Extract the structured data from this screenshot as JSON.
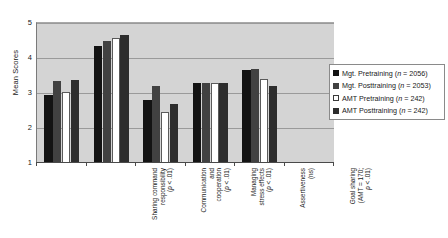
{
  "chart_data": {
    "type": "bar",
    "title": "",
    "xlabel": "",
    "ylabel": "Mean Scores",
    "ylim": [
      1,
      5
    ],
    "yticks": [
      1,
      2,
      3,
      4,
      5
    ],
    "grid": true,
    "legend_position": "right",
    "categories": [
      "Sharing command\nresponsibility\n(p < .01)",
      "Communication\nand\ncooperation\n(p < .01)",
      "Managing\nstress effects\n(p < .01)",
      "Assertiveness\n(ns)",
      "Goal sharing\n(AMT = 170;\np < .01)"
    ],
    "series": [
      {
        "name": "Mgt. Pretraining (n = 2056)",
        "values": [
          2.95,
          4.35,
          2.8,
          3.28,
          3.65
        ]
      },
      {
        "name": "Mgt. Posttraining (n = 2053)",
        "values": [
          3.35,
          4.5,
          3.2,
          3.28,
          3.7
        ]
      },
      {
        "name": "AMT Pretraining (n = 242)",
        "values": [
          3.02,
          4.57,
          2.45,
          3.28,
          3.4
        ]
      },
      {
        "name": "AMT Posttraining (n = 242)",
        "values": [
          3.38,
          4.65,
          2.7,
          3.28,
          3.2
        ]
      }
    ],
    "colors": [
      "#131313",
      "#414141",
      "#ffffff",
      "#2d2d2d"
    ]
  },
  "legend": {
    "items": [
      {
        "label_main": "Mgt. Pretraining (",
        "label_n": "n",
        "label_tail": " = 2056)"
      },
      {
        "label_main": "Mgt. Posttraining (",
        "label_n": "n",
        "label_tail": " = 2053)"
      },
      {
        "label_main": "AMT Pretraining (",
        "label_n": "n",
        "label_tail": " = 242)"
      },
      {
        "label_main": "AMT Posttraining (",
        "label_n": "n",
        "label_tail": " = 242)"
      }
    ]
  }
}
